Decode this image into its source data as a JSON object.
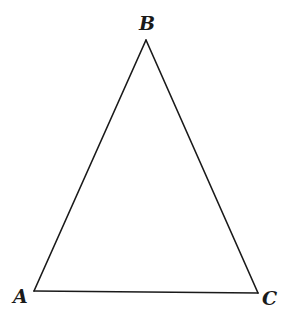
{
  "diagram": {
    "type": "triangle",
    "stroke_color": "#1a1a1a",
    "background": "#ffffff",
    "vertices": [
      {
        "name": "B",
        "label": "B",
        "x": 146,
        "y": 40
      },
      {
        "name": "A",
        "label": "A",
        "x": 34,
        "y": 291
      },
      {
        "name": "C",
        "label": "C",
        "x": 258,
        "y": 293
      }
    ],
    "edges": [
      {
        "from": "A",
        "to": "B"
      },
      {
        "from": "B",
        "to": "C"
      },
      {
        "from": "C",
        "to": "A"
      }
    ]
  }
}
